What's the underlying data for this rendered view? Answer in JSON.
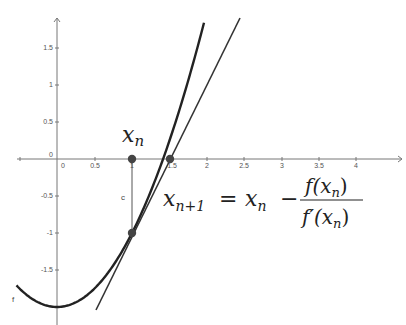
{
  "diagram": {
    "function_label": "f",
    "segment_label": "c",
    "point_label": "x_n",
    "x_ticks": [
      "0",
      "0.5",
      "1",
      "1.5",
      "2",
      "2.5",
      "3",
      "3.5",
      "4"
    ],
    "y_ticks": [
      "1.5",
      "1",
      "0.5",
      "0",
      "-0.5",
      "-1",
      "-1.5"
    ],
    "formula": {
      "lhs_base": "x",
      "lhs_sub": "n+1",
      "equals": "=",
      "rhs_base": "x",
      "rhs_sub": "n",
      "minus": "−",
      "num_text": "f(x",
      "num_sub": "n",
      "num_close": ")",
      "den_text": "f′(x",
      "den_sub": "n",
      "den_close": ")"
    },
    "xn_sym": "x",
    "xn_sub": "n",
    "curve": "f(x) = x^2 - 2",
    "tangent": "y = 2x - 3",
    "points": [
      {
        "x": 1,
        "y": 0
      },
      {
        "x": 1,
        "y": -1
      },
      {
        "x": 1.5,
        "y": 0
      }
    ]
  }
}
